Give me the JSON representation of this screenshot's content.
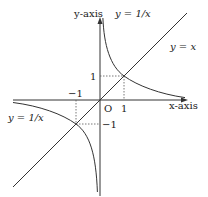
{
  "diagram": {
    "axes": {
      "x_label": "x-axis",
      "y_label": "y-axis",
      "origin_label": "O"
    },
    "curves": [
      {
        "name": "hyperbola",
        "label_top": "y = 1/x",
        "label_left": "y = 1/x"
      },
      {
        "name": "line",
        "label": "y = x"
      }
    ],
    "ticks": {
      "x_pos": "1",
      "x_neg": "−1",
      "y_pos": "1",
      "y_neg": "−1"
    },
    "intersections": [
      {
        "x": 1,
        "y": 1
      },
      {
        "x": -1,
        "y": -1
      }
    ],
    "colors": {
      "stroke": "#333333",
      "dashed": "#555555",
      "background": "#ffffff"
    }
  }
}
